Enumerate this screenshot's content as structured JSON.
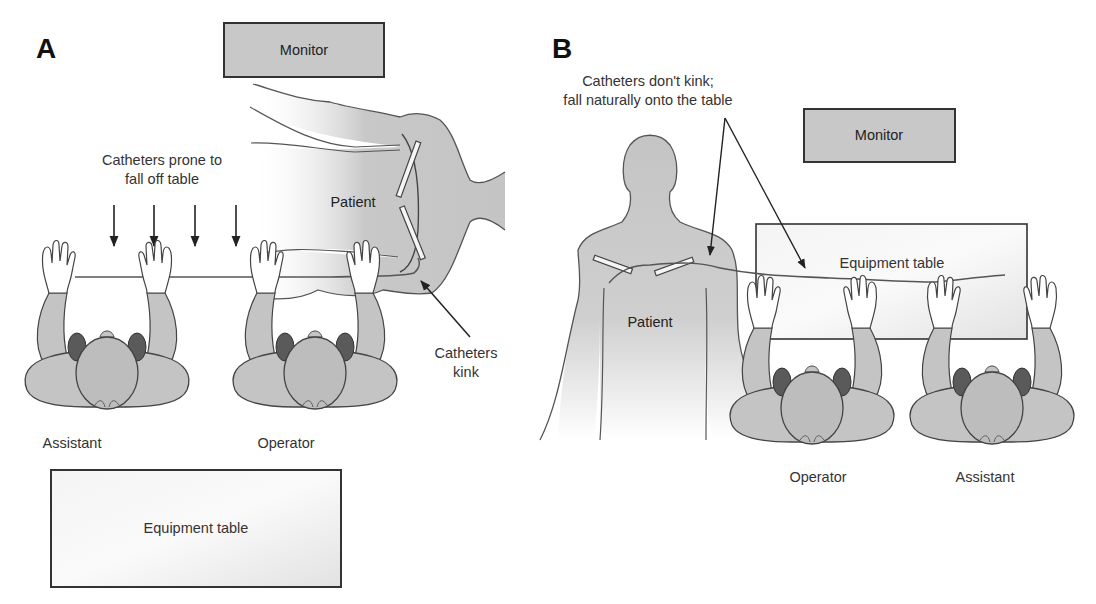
{
  "panels": {
    "a": {
      "label": "A",
      "monitor": "Monitor",
      "patient": "Patient",
      "note_fall": [
        "Catheters prone to",
        "fall off table"
      ],
      "note_kink": [
        "Catheters",
        "kink"
      ],
      "staff": [
        {
          "role": "Assistant"
        },
        {
          "role": "Operator"
        }
      ],
      "equipment_table": "Equipment table"
    },
    "b": {
      "label": "B",
      "note": [
        "Catheters don't kink;",
        "fall naturally onto the table"
      ],
      "monitor": "Monitor",
      "patient": "Patient",
      "equipment_table": "Equipment table",
      "staff": [
        {
          "role": "Operator"
        },
        {
          "role": "Assistant"
        }
      ]
    }
  },
  "colors": {
    "box_gray": "#c8c8c8",
    "body_gray": "#c4c4c4",
    "hair_gray": "#bdbdbd",
    "ear_dark": "#5a5a5a",
    "line": "#444444"
  }
}
